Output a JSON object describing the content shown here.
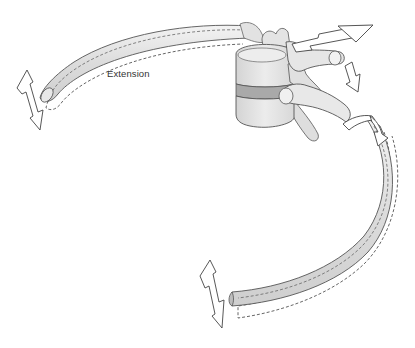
{
  "diagram": {
    "labels": {
      "extension": "Extension"
    },
    "components": [
      {
        "name": "upper-rib",
        "description": "rib extending to upper left, shown with dashed outline of moved position"
      },
      {
        "name": "vertebral-body",
        "description": "vertebral body with intervertebral disc"
      },
      {
        "name": "transverse-process",
        "description": "transverse process with articulating rib head"
      },
      {
        "name": "lower-rib",
        "description": "rib curving down to lower left, shown with dashed outline of moved position"
      }
    ],
    "arrows": [
      {
        "name": "upper-left-vertical-arrow",
        "direction": "up-down"
      },
      {
        "name": "large-right-arrow",
        "direction": "right"
      },
      {
        "name": "small-down-arrow",
        "direction": "down"
      },
      {
        "name": "rotation-band-arrow",
        "direction": "rotation"
      },
      {
        "name": "lower-left-vertical-arrow",
        "direction": "up-down"
      }
    ],
    "colors": {
      "bone_fill": "#e6e6e6",
      "bone_shade": "#cfcfcf",
      "disc_fill": "#a9a9a9",
      "outline": "#555555",
      "dashed": "#555555",
      "arrow_fill": "#ffffff"
    }
  }
}
